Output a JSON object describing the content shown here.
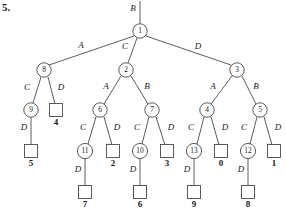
{
  "figure": {
    "problem_number": "5.",
    "root_incoming_label": "B",
    "diagram_type": "game-tree-minimax",
    "internal_nodes": [
      {
        "id": "n1",
        "label": "1",
        "x": 140,
        "y": 31,
        "r": 7.2
      },
      {
        "id": "n8",
        "label": "8",
        "x": 44,
        "y": 70,
        "r": 7.2
      },
      {
        "id": "n2",
        "label": "2",
        "x": 126,
        "y": 70,
        "r": 7.2
      },
      {
        "id": "n3",
        "label": "3",
        "x": 237,
        "y": 70,
        "r": 7.2
      },
      {
        "id": "n9",
        "label": "9",
        "x": 31,
        "y": 110,
        "r": 7.2
      },
      {
        "id": "n6",
        "label": "6",
        "x": 100,
        "y": 110,
        "r": 7.2
      },
      {
        "id": "n7",
        "label": "7",
        "x": 152,
        "y": 110,
        "r": 7.2
      },
      {
        "id": "n4",
        "label": "4",
        "x": 207,
        "y": 110,
        "r": 7.2
      },
      {
        "id": "n5",
        "label": "5",
        "x": 260,
        "y": 110,
        "r": 7.2
      },
      {
        "id": "n11",
        "label": "11",
        "x": 85,
        "y": 151,
        "r": 7.6
      },
      {
        "id": "n10",
        "label": "10",
        "x": 140,
        "y": 151,
        "r": 7.6
      },
      {
        "id": "n13",
        "label": "13",
        "x": 194,
        "y": 151,
        "r": 7.6
      },
      {
        "id": "n12",
        "label": "12",
        "x": 248,
        "y": 151,
        "r": 7.6
      }
    ],
    "leaf_nodes": [
      {
        "id": "L4",
        "value": "4",
        "x": 56,
        "y": 110,
        "size": 13
      },
      {
        "id": "L5",
        "value": "5",
        "x": 31,
        "y": 151,
        "size": 13
      },
      {
        "id": "L2",
        "value": "2",
        "x": 113,
        "y": 151,
        "size": 13
      },
      {
        "id": "L3",
        "value": "3",
        "x": 167,
        "y": 151,
        "size": 13
      },
      {
        "id": "L0",
        "value": "0",
        "x": 221,
        "y": 151,
        "size": 13
      },
      {
        "id": "L1",
        "value": "1",
        "x": 274,
        "y": 151,
        "size": 13
      },
      {
        "id": "L7",
        "value": "7",
        "x": 85,
        "y": 192,
        "size": 13
      },
      {
        "id": "L6",
        "value": "6",
        "x": 140,
        "y": 192,
        "size": 13
      },
      {
        "id": "L9",
        "value": "9",
        "x": 194,
        "y": 192,
        "size": 13
      },
      {
        "id": "L8",
        "value": "8",
        "x": 248,
        "y": 192,
        "size": 13
      }
    ],
    "edges": [
      {
        "id": "e-root-in",
        "from": "top",
        "to": "n1",
        "x1": 140,
        "y1": 1,
        "x2": 140,
        "y2": 24,
        "label": "B",
        "lx": 133,
        "ly": 9
      },
      {
        "id": "e-1-8",
        "from": "n1",
        "to": "n8",
        "x1": 134,
        "y1": 36,
        "x2": 49,
        "y2": 65,
        "label": "A",
        "lx": 81,
        "ly": 46
      },
      {
        "id": "e-1-2",
        "from": "n1",
        "to": "n2",
        "x1": 137,
        "y1": 38,
        "x2": 128,
        "y2": 63,
        "label": "C",
        "lx": 125,
        "ly": 47
      },
      {
        "id": "e-1-3",
        "from": "n1",
        "to": "n3",
        "x1": 146,
        "y1": 36,
        "x2": 231,
        "y2": 65,
        "label": "D",
        "lx": 198,
        "ly": 47
      },
      {
        "id": "e-8-9",
        "from": "n8",
        "to": "n9",
        "x1": 41,
        "y1": 77,
        "x2": 33,
        "y2": 103,
        "label": "C",
        "lx": 27,
        "ly": 88
      },
      {
        "id": "e-8-4",
        "from": "n8",
        "to": "L4",
        "x1": 48,
        "y1": 77,
        "x2": 55,
        "y2": 104,
        "label": "D",
        "lx": 61,
        "ly": 88
      },
      {
        "id": "e-2-6",
        "from": "n2",
        "to": "n6",
        "x1": 121,
        "y1": 76,
        "x2": 104,
        "y2": 104,
        "label": "A",
        "lx": 106,
        "ly": 87
      },
      {
        "id": "e-2-7",
        "from": "n2",
        "to": "n7",
        "x1": 131,
        "y1": 76,
        "x2": 148,
        "y2": 104,
        "label": "B",
        "lx": 147,
        "ly": 87
      },
      {
        "id": "e-3-4",
        "from": "n3",
        "to": "n4",
        "x1": 232,
        "y1": 76,
        "x2": 211,
        "y2": 104,
        "label": "A",
        "lx": 213,
        "ly": 87
      },
      {
        "id": "e-3-5",
        "from": "n3",
        "to": "n5",
        "x1": 242,
        "y1": 76,
        "x2": 256,
        "y2": 104,
        "label": "B",
        "lx": 256,
        "ly": 87
      },
      {
        "id": "e-9-5",
        "from": "n9",
        "to": "L5",
        "x1": 31,
        "y1": 117,
        "x2": 31,
        "y2": 145,
        "label": "D",
        "lx": 24,
        "ly": 128
      },
      {
        "id": "e-6-11",
        "from": "n6",
        "to": "n11",
        "x1": 96,
        "y1": 117,
        "x2": 88,
        "y2": 144,
        "label": "C",
        "lx": 83,
        "ly": 128
      },
      {
        "id": "e-6-2",
        "from": "n6",
        "to": "L2",
        "x1": 104,
        "y1": 117,
        "x2": 112,
        "y2": 145,
        "label": "D",
        "lx": 117,
        "ly": 128
      },
      {
        "id": "e-7-10",
        "from": "n7",
        "to": "n10",
        "x1": 149,
        "y1": 117,
        "x2": 142,
        "y2": 144,
        "label": "C",
        "lx": 137,
        "ly": 128
      },
      {
        "id": "e-7-3",
        "from": "n7",
        "to": "L3",
        "x1": 156,
        "y1": 117,
        "x2": 165,
        "y2": 145,
        "label": "D",
        "lx": 171,
        "ly": 128
      },
      {
        "id": "e-4-13",
        "from": "n4",
        "to": "n13",
        "x1": 204,
        "y1": 117,
        "x2": 197,
        "y2": 144,
        "label": "C",
        "lx": 191,
        "ly": 128
      },
      {
        "id": "e-4-0",
        "from": "n4",
        "to": "L0",
        "x1": 211,
        "y1": 117,
        "x2": 219,
        "y2": 145,
        "label": "D",
        "lx": 225,
        "ly": 128
      },
      {
        "id": "e-5-12",
        "from": "n5",
        "to": "n12",
        "x1": 257,
        "y1": 117,
        "x2": 250,
        "y2": 144,
        "label": "C",
        "lx": 244,
        "ly": 128
      },
      {
        "id": "e-5-1",
        "from": "n5",
        "to": "L1",
        "x1": 264,
        "y1": 117,
        "x2": 272,
        "y2": 145,
        "label": "D",
        "lx": 278,
        "ly": 128
      },
      {
        "id": "e-11-7",
        "from": "n11",
        "to": "L7",
        "x1": 85,
        "y1": 159,
        "x2": 85,
        "y2": 186,
        "label": "D",
        "lx": 78,
        "ly": 170
      },
      {
        "id": "e-10-6",
        "from": "n10",
        "to": "L6",
        "x1": 140,
        "y1": 159,
        "x2": 140,
        "y2": 186,
        "label": "D",
        "lx": 133,
        "ly": 170
      },
      {
        "id": "e-13-9",
        "from": "n13",
        "to": "L9",
        "x1": 194,
        "y1": 159,
        "x2": 194,
        "y2": 186,
        "label": "D",
        "lx": 187,
        "ly": 170
      },
      {
        "id": "e-12-8",
        "from": "n12",
        "to": "L8",
        "x1": 248,
        "y1": 159,
        "x2": 248,
        "y2": 186,
        "label": "D",
        "lx": 241,
        "ly": 170
      }
    ],
    "colors": {
      "stroke": "#4a4a4a",
      "text": "#1a1a1a",
      "background": "#ffffff"
    }
  }
}
